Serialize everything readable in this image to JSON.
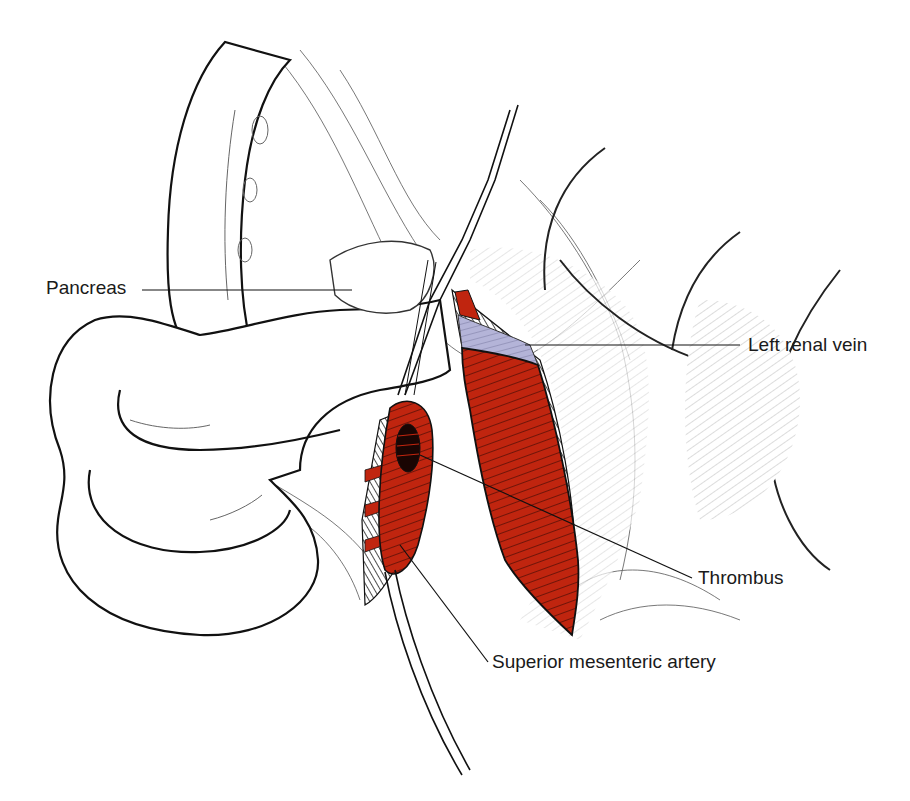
{
  "figure": {
    "type": "anatomical-illustration",
    "colors": {
      "vessel_red": "#c0250f",
      "vein_lavender": "#b4b4d8",
      "outline": "#1a1a1a",
      "background": "#ffffff"
    },
    "labels": [
      {
        "id": "pancreas",
        "text": "Pancreas",
        "x": 46,
        "y": 277,
        "line": [
          142,
          290,
          352,
          290
        ]
      },
      {
        "id": "left-renal-vein",
        "text": "Left renal vein",
        "x": 748,
        "y": 335,
        "line": [
          525,
          345,
          740,
          345
        ]
      },
      {
        "id": "thrombus",
        "text": "Thrombus",
        "x": 698,
        "y": 567,
        "line": [
          420,
          455,
          692,
          578
        ]
      },
      {
        "id": "superior-mesenteric-artery",
        "text": "Superior mesenteric artery",
        "x": 492,
        "y": 651,
        "line": [
          400,
          545,
          488,
          662
        ]
      }
    ]
  }
}
